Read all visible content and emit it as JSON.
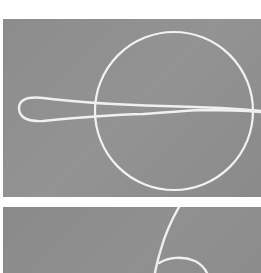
{
  "figure": {
    "panels": [
      {
        "id": "top",
        "description": "White cord forming an elongated loop passing horizontally through a white ring on a grey background",
        "background_color": "#8c8c8c",
        "stroke_color": "#f2f2f2"
      },
      {
        "id": "bottom",
        "description": "White cord curving downward into a hook shape on a grey background (partially cropped)",
        "background_color": "#8a8a8a",
        "stroke_color": "#f2f2f2"
      }
    ]
  }
}
